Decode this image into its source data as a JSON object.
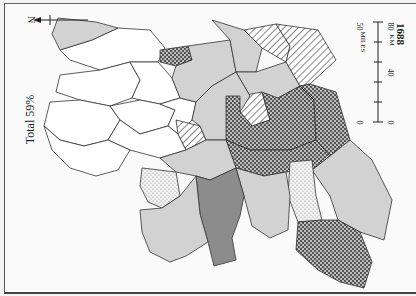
{
  "map": {
    "year": "1688",
    "total_label": "Total 59%",
    "north_label": "N",
    "scale": {
      "miles_label": "MILES",
      "miles_ticks": [
        "0",
        "50"
      ],
      "km_label": "KM",
      "km_ticks": [
        "0",
        "40",
        "80"
      ]
    },
    "legend_fills": {
      "none": "#ffffff",
      "light": "#d2d2d2",
      "dark": "#8c8c8c",
      "dotted": "stipple",
      "hatched": "diagonal-lines",
      "crosshatched": "crosshatch"
    }
  }
}
